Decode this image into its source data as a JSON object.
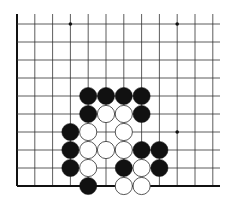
{
  "diagram": {
    "type": "go-board-partial",
    "title": "",
    "grid": {
      "origin_x": 17,
      "origin_y": 24,
      "col_spacing": 17.8,
      "row_spacing": 18,
      "columns": 12,
      "rows": 10,
      "line_top": 14,
      "line_right": 220,
      "left_edge_is_board_edge": true,
      "bottom_edge_is_board_edge": true
    },
    "colors": {
      "line": "#333333",
      "edge": "#111111",
      "black_stone": "#111111",
      "white_stone": "#ffffff",
      "white_outline": "#444444",
      "background": "#ffffff"
    },
    "star_points": [
      {
        "col": 3,
        "row": 0
      },
      {
        "col": 9,
        "row": 0
      },
      {
        "col": 9,
        "row": 6
      }
    ],
    "stones": [
      {
        "color": "black",
        "col": 4,
        "row": 4
      },
      {
        "color": "black",
        "col": 5,
        "row": 4
      },
      {
        "color": "black",
        "col": 6,
        "row": 4
      },
      {
        "color": "black",
        "col": 7,
        "row": 4
      },
      {
        "color": "black",
        "col": 4,
        "row": 5
      },
      {
        "color": "white",
        "col": 5,
        "row": 5
      },
      {
        "color": "white",
        "col": 6,
        "row": 5
      },
      {
        "color": "black",
        "col": 7,
        "row": 5
      },
      {
        "color": "black",
        "col": 3,
        "row": 6
      },
      {
        "color": "white",
        "col": 4,
        "row": 6
      },
      {
        "color": "white",
        "col": 6,
        "row": 6
      },
      {
        "color": "black",
        "col": 3,
        "row": 7
      },
      {
        "color": "white",
        "col": 4,
        "row": 7
      },
      {
        "color": "white",
        "col": 5,
        "row": 7
      },
      {
        "color": "white",
        "col": 6,
        "row": 7
      },
      {
        "color": "black",
        "col": 7,
        "row": 7
      },
      {
        "color": "black",
        "col": 8,
        "row": 7
      },
      {
        "color": "black",
        "col": 3,
        "row": 8
      },
      {
        "color": "white",
        "col": 4,
        "row": 8
      },
      {
        "color": "black",
        "col": 6,
        "row": 8
      },
      {
        "color": "white",
        "col": 7,
        "row": 8
      },
      {
        "color": "black",
        "col": 8,
        "row": 8
      },
      {
        "color": "black",
        "col": 4,
        "row": 9
      },
      {
        "color": "white",
        "col": 6,
        "row": 9
      },
      {
        "color": "white",
        "col": 7,
        "row": 9
      }
    ],
    "stone_radius": 8.6
  }
}
